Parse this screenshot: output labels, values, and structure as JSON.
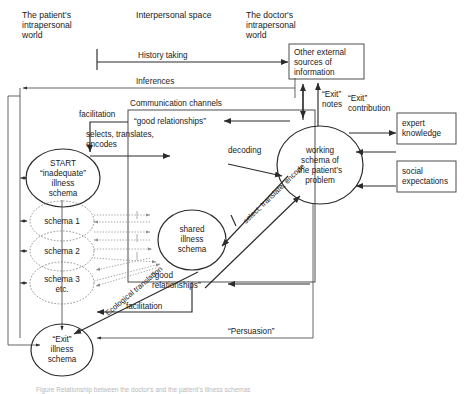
{
  "figure": {
    "kind": "flow-diagram",
    "caption_clipped": "Figure  Relationship between the doctor's and the patient's illness schemas"
  },
  "headers": [
    {
      "id": "patient-world",
      "lines": [
        "The patient's",
        "intrapersonal",
        "world"
      ]
    },
    {
      "id": "interpersonal-space",
      "lines": [
        "Interpersonal space"
      ]
    },
    {
      "id": "doctor-world",
      "lines": [
        "The doctor's",
        "intrapersonal",
        "world"
      ]
    }
  ],
  "nodes": {
    "start_circle": {
      "lines": [
        "START",
        "“inadequate”",
        "illness",
        "schema"
      ]
    },
    "schema1": {
      "lines": [
        "schema 1"
      ]
    },
    "schema2": {
      "lines": [
        "schema 2"
      ]
    },
    "schema3": {
      "lines": [
        "schema 3",
        "etc."
      ]
    },
    "exit_circle": {
      "lines": [
        "“Exit”",
        "illness",
        "schema"
      ]
    },
    "shared_schema": {
      "lines": [
        "shared",
        "illness",
        "schema"
      ]
    },
    "working_schema": {
      "lines": [
        "working",
        "schema of",
        "the patient’s",
        "problem"
      ]
    },
    "external_sources": {
      "lines": [
        "Other external",
        "sources of",
        "information"
      ]
    },
    "expert_knowledge": {
      "lines": [
        "expert",
        "knowledge"
      ]
    },
    "social_expectations": {
      "lines": [
        "social",
        "expectations"
      ]
    }
  },
  "labels": {
    "history_taking": "History taking",
    "inferences": "Inferences",
    "communication_channels": "Communication channels",
    "good_relationships_top": "“good relationships”",
    "good_relationships_bottom_l1": "“good",
    "good_relationships_bottom_l2": "relationships”",
    "facilitation_top": "facilitation",
    "facilitation_bottom": "facilitation",
    "selects_translates_l1": "selects, translates,",
    "selects_translates_l2": "encodes",
    "decoding": "decoding",
    "select_translate_encode": "select, translate, encode",
    "ecological_translation": "Ecological translation",
    "persuasion": "“Persuasion”",
    "exit_notes_l1": "“Exit”",
    "exit_notes_l2": "notes",
    "exit_contribution_l1": "“Exit”",
    "exit_contribution_l2": "contribution"
  },
  "colors": {
    "ink": "#1a1a1a",
    "line": "#2b2b2b",
    "grey_line": "#9a9a9a",
    "dotted": "#8a8a8a",
    "background": "#ffffff",
    "caption": "#b9b9b9"
  }
}
